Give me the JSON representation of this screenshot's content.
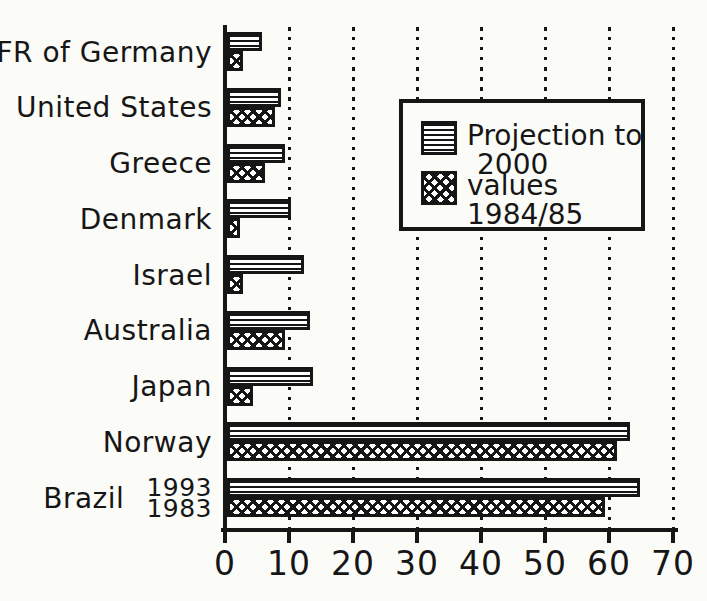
{
  "chart_data": {
    "type": "bar",
    "orientation": "horizontal",
    "categories": [
      "FR of Germany",
      "United States",
      "Greece",
      "Denmark",
      "Israel",
      "Australia",
      "Japan",
      "Norway",
      "Brazil"
    ],
    "series": [
      {
        "name": "Projection to 2000",
        "pattern": "horizontal-stripes",
        "values": [
          5.5,
          8.5,
          9,
          10,
          12,
          13,
          13.5,
          63,
          64.5
        ]
      },
      {
        "name": "values 1984/85",
        "pattern": "crosshatch",
        "values": [
          2.5,
          7.5,
          6,
          2,
          2.5,
          9,
          4,
          61,
          59
        ]
      }
    ],
    "xlim": [
      0,
      70
    ],
    "x_ticks": [
      "0",
      "10",
      "20",
      "30",
      "40",
      "50",
      "60",
      "70"
    ],
    "grid": "dotted vertical gridlines at every 10 units",
    "legend_position": "upper-right",
    "annotations": {
      "brazil_projection_year": "1993",
      "brazil_values_year": "1983"
    }
  },
  "legend": {
    "entries": [
      {
        "swatch": "horizontal-stripes-swatch",
        "line1": "Projection to",
        "line2": "2000"
      },
      {
        "swatch": "crosshatch-swatch",
        "line1": "values",
        "line2": "1984/85"
      }
    ]
  },
  "colors": {
    "ink": "#161616",
    "paper": "#fbfbf8"
  }
}
